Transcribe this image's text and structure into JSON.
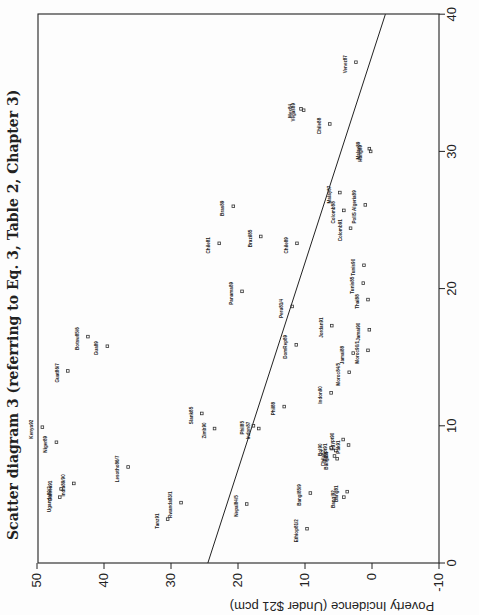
{
  "chart_data": {
    "type": "scatter",
    "title": "Scatter diagram 3 (referring to Eq. 3, Table 2, Chapter 3)",
    "xlabel": "",
    "ylabel": "Poverty Incidence (Under $21 pcm)",
    "xlim": [
      0,
      40
    ],
    "ylim": [
      -10,
      50
    ],
    "x_ticks": [
      "0",
      "10",
      "20",
      "30",
      "40"
    ],
    "y_ticks": [
      "-10",
      "0",
      "10",
      "20",
      "30",
      "40",
      "50"
    ],
    "orientation": "page rotated 90 degrees; x-axis runs vertically on the right, y-axis runs horizontally along the bottom (mirrored)",
    "grid": false,
    "regression_line": {
      "x": [
        0,
        40
      ],
      "y": [
        24.5,
        -2.0
      ]
    },
    "points": [
      {
        "label": "Venez87",
        "x": 36.5,
        "y": 2.4
      },
      {
        "label": "Mex84",
        "x": 33.1,
        "y": 10.6
      },
      {
        "label": "Vegas89",
        "x": 33.0,
        "y": 10.2
      },
      {
        "label": "Chile88",
        "x": 32.0,
        "y": 6.3
      },
      {
        "label": "Malay89",
        "x": 30.2,
        "y": 0.4
      },
      {
        "label": "Hung89",
        "x": 30.0,
        "y": 0.2
      },
      {
        "label": "Malay87",
        "x": 27.0,
        "y": 4.8
      },
      {
        "label": "Colomb88",
        "x": 25.7,
        "y": 4.2
      },
      {
        "label": "Colomb91",
        "x": 24.4,
        "y": 3.2
      },
      {
        "label": "PollS Algeria89",
        "x": 26.1,
        "y": 1.0
      },
      {
        "label": "Bras89",
        "x": 26.0,
        "y": 20.7
      },
      {
        "label": "Brazil85",
        "x": 23.8,
        "y": 16.6
      },
      {
        "label": "Chile81",
        "x": 23.3,
        "y": 22.8
      },
      {
        "label": "Chile89",
        "x": 23.3,
        "y": 11.2
      },
      {
        "label": "Panama89",
        "x": 19.8,
        "y": 19.4
      },
      {
        "label": "Peru81/4",
        "x": 18.7,
        "y": 11.9
      },
      {
        "label": "Tunis90",
        "x": 21.7,
        "y": 1.2
      },
      {
        "label": "Tunis85",
        "x": 20.4,
        "y": 1.3
      },
      {
        "label": "Thai88",
        "x": 19.2,
        "y": 0.6
      },
      {
        "label": "Jordan91",
        "x": 17.3,
        "y": 6.0
      },
      {
        "label": "DomRep89",
        "x": 15.9,
        "y": 11.3
      },
      {
        "label": "Jamai90",
        "x": 17.0,
        "y": 0.4
      },
      {
        "label": "Moroc90/1",
        "x": 15.5,
        "y": 0.6
      },
      {
        "label": "Jamai88",
        "x": 15.3,
        "y": 2.8
      },
      {
        "label": "Moroc84/5",
        "x": 13.9,
        "y": 3.4
      },
      {
        "label": "Indon90",
        "x": 12.4,
        "y": 6.1
      },
      {
        "label": "Phil88",
        "x": 11.4,
        "y": 13.1
      },
      {
        "label": "Phil85",
        "x": 10.0,
        "y": 17.7
      },
      {
        "label": "Indon87",
        "x": 9.8,
        "y": 16.9
      },
      {
        "label": "Slank85",
        "x": 10.9,
        "y": 25.4
      },
      {
        "label": "Zimb90",
        "x": 9.8,
        "y": 23.5
      },
      {
        "label": "Bol90",
        "x": 8.4,
        "y": 6.1
      },
      {
        "label": "Egypt91",
        "x": 8.2,
        "y": 5.4
      },
      {
        "label": "Chile87",
        "x": 7.8,
        "y": 5.6
      },
      {
        "label": "Bangl86",
        "x": 7.6,
        "y": 5.2
      },
      {
        "label": "Pak91",
        "x": 8.6,
        "y": 3.5
      },
      {
        "label": "Egypt90",
        "x": 9.0,
        "y": 4.3
      },
      {
        "label": "Nepal84/5",
        "x": 4.3,
        "y": 18.7
      },
      {
        "label": "Bangl85/9",
        "x": 5.1,
        "y": 9.2
      },
      {
        "label": "Bangl92",
        "x": 4.8,
        "y": 4.2
      },
      {
        "label": "Bang81",
        "x": 5.2,
        "y": 3.7
      },
      {
        "label": "Ethiop81/2",
        "x": 2.5,
        "y": 9.7
      },
      {
        "label": "Rwanda83/1",
        "x": 4.4,
        "y": 28.5
      },
      {
        "label": "Tanz91",
        "x": 3.2,
        "y": 30.5
      },
      {
        "label": "Lesotho86/7",
        "x": 7.0,
        "y": 36.4
      },
      {
        "label": "India89/90",
        "x": 5.8,
        "y": 44.5
      },
      {
        "label": "Guinea91",
        "x": 5.4,
        "y": 46.4
      },
      {
        "label": "Uganda89/2",
        "x": 4.8,
        "y": 46.6
      },
      {
        "label": "Niger89",
        "x": 8.8,
        "y": 47.1
      },
      {
        "label": "Kenya92",
        "x": 9.9,
        "y": 49.2
      },
      {
        "label": "Guat86/7",
        "x": 14.0,
        "y": 45.4
      },
      {
        "label": "Botsw85/6",
        "x": 16.5,
        "y": 42.4
      },
      {
        "label": "Gua89",
        "x": 15.8,
        "y": 39.5
      }
    ]
  }
}
